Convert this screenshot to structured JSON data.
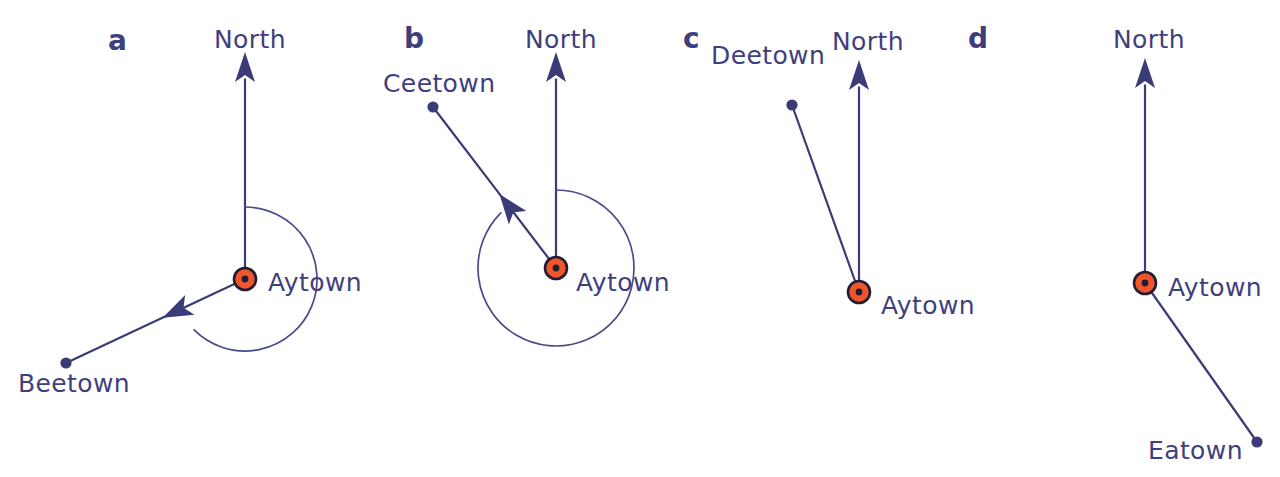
{
  "figure": {
    "background": "#ffffff",
    "width": 1280,
    "height": 477,
    "colors": {
      "ink": "#3b3b78",
      "ink_text": "#3f3f7d",
      "arc": "#4a4a8c",
      "marker_fill": "#f0562a",
      "marker_ring": "#201c35"
    }
  },
  "panels": [
    {
      "id": "a",
      "letter": "a",
      "letter_pos": {
        "x": 108,
        "y": 50
      },
      "origin": {
        "label": "Aytown",
        "x": 245,
        "y": 279,
        "label_x": 268,
        "label_y": 291
      },
      "north": {
        "label": "North",
        "tip_x": 245,
        "tip_y": 52,
        "label_x": 214,
        "label_y": 48
      },
      "target": {
        "label": "Beetown",
        "x": 66,
        "y": 363,
        "label_x": 18,
        "label_y": 392,
        "has_arrowhead": true
      },
      "arc": {
        "present": true,
        "radius": 72,
        "start_deg": 0,
        "sweep_deg": 225,
        "arrow_at_end": true
      },
      "bearing_note": "reflex bearing measured clockwise from North to Beetown"
    },
    {
      "id": "b",
      "letter": "b",
      "letter_pos": {
        "x": 404,
        "y": 48
      },
      "origin": {
        "label": "Aytown",
        "x": 556,
        "y": 268,
        "label_x": 576,
        "label_y": 291
      },
      "north": {
        "label": "North",
        "tip_x": 556,
        "tip_y": 52,
        "label_x": 525,
        "label_y": 48
      },
      "target": {
        "label": "Ceetown",
        "x": 433,
        "y": 107,
        "label_x": 383,
        "label_y": 92,
        "has_arrowhead": true
      },
      "arc": {
        "present": true,
        "radius": 78,
        "start_deg": 0,
        "sweep_deg": 315,
        "arrow_at_end": true
      },
      "bearing_note": "reflex bearing measured clockwise from North to Ceetown"
    },
    {
      "id": "c",
      "letter": "c",
      "letter_pos": {
        "x": 683,
        "y": 48
      },
      "origin": {
        "label": "Aytown",
        "x": 859,
        "y": 292,
        "label_x": 881,
        "label_y": 314
      },
      "north": {
        "label": "North",
        "tip_x": 859,
        "tip_y": 60,
        "label_x": 832,
        "label_y": 50
      },
      "target": {
        "label": "Deetown",
        "x": 792,
        "y": 105,
        "label_x": 711,
        "label_y": 64,
        "has_arrowhead": false
      },
      "arc": {
        "present": false,
        "radius": 0,
        "start_deg": 0,
        "sweep_deg": 0,
        "arrow_at_end": false
      },
      "bearing_note": "no bearing arc drawn"
    },
    {
      "id": "d",
      "letter": "d",
      "letter_pos": {
        "x": 968,
        "y": 48
      },
      "origin": {
        "label": "Aytown",
        "x": 1145,
        "y": 283,
        "label_x": 1168,
        "label_y": 296
      },
      "north": {
        "label": "North",
        "tip_x": 1145,
        "tip_y": 58,
        "label_x": 1113,
        "label_y": 48
      },
      "target": {
        "label": "Eatown",
        "x": 1257,
        "y": 442,
        "label_x": 1148,
        "label_y": 459,
        "has_arrowhead": false
      },
      "arc": {
        "present": false,
        "radius": 0,
        "start_deg": 0,
        "sweep_deg": 0,
        "arrow_at_end": false
      },
      "bearing_note": "no bearing arc drawn"
    }
  ],
  "labels": {
    "north": "North",
    "aytown": "Aytown",
    "beetown": "Beetown",
    "ceetown": "Ceetown",
    "deetown": "Deetown",
    "eatown": "Eatown"
  }
}
